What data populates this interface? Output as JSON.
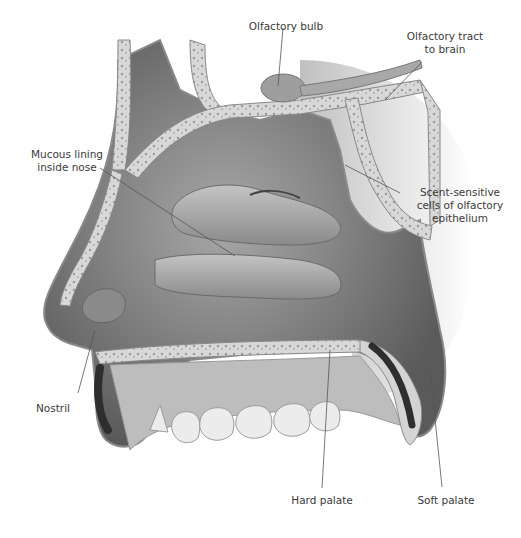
{
  "figure": {
    "colors": {
      "background": "#ffffff",
      "cavity_dark": "#6e6e6e",
      "cavity_mid": "#9a9a9a",
      "bone": "#d6d6d6",
      "bone_edge": "#8a8a8a",
      "muscle": "#2e2e2e",
      "teeth": "#e8e8e8",
      "leader_line": "#555555",
      "label_text": "#3a3a3a"
    }
  },
  "labels": {
    "olfactory_bulb": "Olfactory bulb",
    "olfactory_tract_line1": "Olfactory tract",
    "olfactory_tract_line2": "to brain",
    "mucous_lining_line1": "Mucous lining",
    "mucous_lining_line2": "inside nose",
    "scent_cells_line1": "Scent-sensitive",
    "scent_cells_line2": "cells of olfactory",
    "scent_cells_line3": "epithelium",
    "nostril": "Nostril",
    "hard_palate": "Hard palate",
    "soft_palate": "Soft palate"
  }
}
